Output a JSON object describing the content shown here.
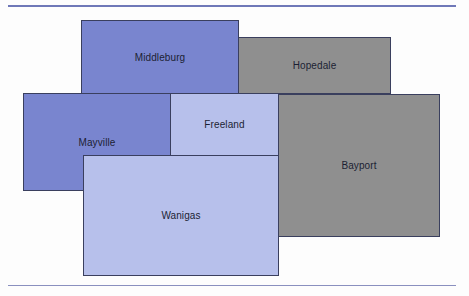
{
  "diagram": {
    "type": "area-map",
    "colors": {
      "dark_blue": "#7985cf",
      "light_blue": "#b7c0eb",
      "gray": "#8f8f8f",
      "border": "#3a3f5e",
      "rule": "#6f78b8"
    },
    "regions": [
      {
        "name": "Middleburg",
        "color": "#7985cf",
        "x": 81,
        "y": 20,
        "w": 158,
        "h": 74
      },
      {
        "name": "Hopedale",
        "color": "#8f8f8f",
        "x": 238,
        "y": 37,
        "w": 153,
        "h": 57
      },
      {
        "name": "Mayville",
        "color": "#7985cf",
        "x": 23,
        "y": 93,
        "w": 148,
        "h": 98
      },
      {
        "name": "Freeland",
        "color": "#b7c0eb",
        "x": 170,
        "y": 93,
        "w": 109,
        "h": 63
      },
      {
        "name": "Bayport",
        "color": "#8f8f8f",
        "x": 278,
        "y": 94,
        "w": 162,
        "h": 143
      },
      {
        "name": "Wanigas",
        "color": "#b7c0eb",
        "x": 83,
        "y": 155,
        "w": 196,
        "h": 121
      }
    ]
  }
}
